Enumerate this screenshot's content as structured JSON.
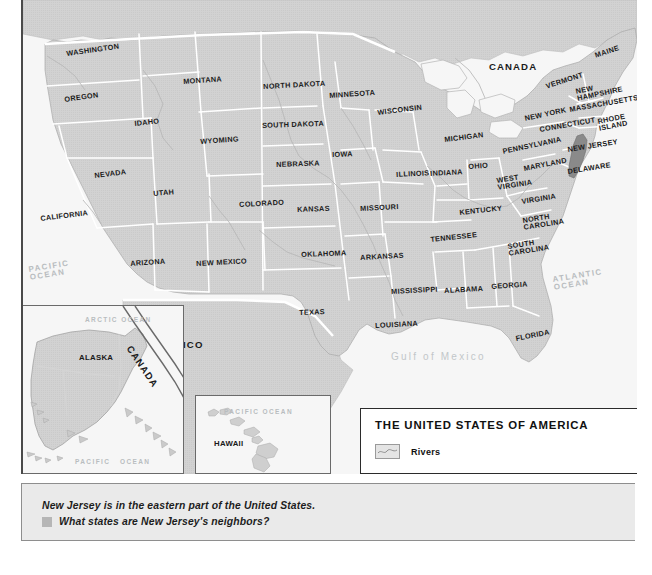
{
  "map": {
    "title": "THE UNITED STATES OF AMERICA",
    "legend": {
      "rivers_label": "Rivers",
      "rivers_swatch": "river-swatch"
    },
    "colors": {
      "land": "#d2d2d2",
      "highlight_state": "#8a8a8a",
      "water": "#f6f6f6",
      "border": "#ffffff",
      "frame": "#4a4a4a",
      "caption_bg": "#eaeaea"
    },
    "highlighted_state": "NEW JERSEY",
    "countries": [
      {
        "name": "CANADA",
        "x": 487,
        "y": 66,
        "rot": 0,
        "cls": "big"
      },
      {
        "name": "MEXICO",
        "x": 157,
        "y": 345,
        "rot": 0,
        "cls": "big"
      },
      {
        "name": "CANADA",
        "x": 96,
        "y": 337,
        "rot": 52,
        "cls": "big"
      }
    ],
    "states": [
      {
        "name": "WASHINGTON",
        "x": 64,
        "y": 55,
        "rot": -8
      },
      {
        "name": "OREGON",
        "x": 62,
        "y": 100,
        "rot": -8
      },
      {
        "name": "IDAHO",
        "x": 132,
        "y": 124,
        "rot": -6
      },
      {
        "name": "MONTANA",
        "x": 181,
        "y": 82,
        "rot": -4
      },
      {
        "name": "WYOMING",
        "x": 198,
        "y": 142,
        "rot": -4
      },
      {
        "name": "NEVADA",
        "x": 92,
        "y": 176,
        "rot": -7
      },
      {
        "name": "UTAH",
        "x": 151,
        "y": 194,
        "rot": -5
      },
      {
        "name": "CALIFORNIA",
        "x": 38,
        "y": 219,
        "rot": -7
      },
      {
        "name": "ARIZONA",
        "x": 128,
        "y": 264,
        "rot": -4
      },
      {
        "name": "NEW MEXICO",
        "x": 194,
        "y": 264,
        "rot": -3
      },
      {
        "name": "COLORADO",
        "x": 237,
        "y": 205,
        "rot": -3
      },
      {
        "name": "NORTH DAKOTA",
        "x": 261,
        "y": 87,
        "rot": -3
      },
      {
        "name": "SOUTH DAKOTA",
        "x": 260,
        "y": 126,
        "rot": -2
      },
      {
        "name": "NEBRASKA",
        "x": 274,
        "y": 165,
        "rot": -2
      },
      {
        "name": "KANSAS",
        "x": 295,
        "y": 210,
        "rot": -2
      },
      {
        "name": "OKLAHOMA",
        "x": 299,
        "y": 255,
        "rot": -2
      },
      {
        "name": "TEXAS",
        "x": 297,
        "y": 313,
        "rot": -2
      },
      {
        "name": "MINNESOTA",
        "x": 327,
        "y": 96,
        "rot": -4
      },
      {
        "name": "IOWA",
        "x": 330,
        "y": 155,
        "rot": -2
      },
      {
        "name": "MISSOURI",
        "x": 358,
        "y": 209,
        "rot": -3
      },
      {
        "name": "ARKANSAS",
        "x": 358,
        "y": 258,
        "rot": -3
      },
      {
        "name": "LOUISIANA",
        "x": 373,
        "y": 326,
        "rot": -3
      },
      {
        "name": "WISCONSIN",
        "x": 375,
        "y": 113,
        "rot": -7
      },
      {
        "name": "ILLINOIS",
        "x": 394,
        "y": 175,
        "rot": -3
      },
      {
        "name": "INDIANA",
        "x": 428,
        "y": 174,
        "rot": -3
      },
      {
        "name": "MICHIGAN",
        "x": 442,
        "y": 140,
        "rot": -7
      },
      {
        "name": "OHIO",
        "x": 466,
        "y": 167,
        "rot": -4
      },
      {
        "name": "KENTUCKY",
        "x": 457,
        "y": 213,
        "rot": -6
      },
      {
        "name": "TENNESSEE",
        "x": 428,
        "y": 240,
        "rot": -6
      },
      {
        "name": "MISSISSIPPI",
        "x": 389,
        "y": 292,
        "rot": -3
      },
      {
        "name": "ALABAMA",
        "x": 442,
        "y": 291,
        "rot": -3
      },
      {
        "name": "GEORGIA",
        "x": 489,
        "y": 287,
        "rot": -4
      },
      {
        "name": "FLORIDA",
        "x": 513,
        "y": 339,
        "rot": -11
      },
      {
        "name": "SOUTH\nCAROLINA",
        "x": 505,
        "y": 247,
        "rot": -9
      },
      {
        "name": "NORTH\nCAROLINA",
        "x": 520,
        "y": 221,
        "rot": -9
      },
      {
        "name": "VIRGINIA",
        "x": 519,
        "y": 202,
        "rot": -9
      },
      {
        "name": "WEST\nVIRGINIA",
        "x": 494,
        "y": 181,
        "rot": -9
      },
      {
        "name": "MARYLAND",
        "x": 521,
        "y": 169,
        "rot": -11
      },
      {
        "name": "PENNSYLVANIA",
        "x": 500,
        "y": 152,
        "rot": -12
      },
      {
        "name": "NEW YORK",
        "x": 522,
        "y": 119,
        "rot": -12
      },
      {
        "name": "VERMONT",
        "x": 543,
        "y": 87,
        "rot": -18
      },
      {
        "name": "NEW\nHAMPSHIRE",
        "x": 573,
        "y": 92,
        "rot": -12
      },
      {
        "name": "MAINE",
        "x": 592,
        "y": 56,
        "rot": -18
      },
      {
        "name": "MASSACHUSETTS",
        "x": 567,
        "y": 110,
        "rot": -10
      },
      {
        "name": "CONNECTICUT",
        "x": 537,
        "y": 130,
        "rot": -10
      },
      {
        "name": "RHODE\nISLAND",
        "x": 595,
        "y": 122,
        "rot": -11
      },
      {
        "name": "NEW JERSEY",
        "x": 565,
        "y": 150,
        "rot": -9
      },
      {
        "name": "DELAWARE",
        "x": 565,
        "y": 172,
        "rot": -9
      }
    ],
    "oceans": [
      {
        "name": "PACIFIC\nOCEAN",
        "x": 26,
        "y": 266,
        "rot": -9
      },
      {
        "name": "ATLANTIC\nOCEAN",
        "x": 550,
        "y": 276,
        "rot": -9
      },
      {
        "name": "Gulf of Mexico",
        "x": 389,
        "y": 356,
        "rot": 0
      }
    ],
    "insets": {
      "alaska": {
        "state_label": "ALASKA",
        "country_label": "CANADA",
        "ocean_top": "ARCTIC OCEAN",
        "ocean_bottom": "PACIFIC   OCEAN"
      },
      "hawaii": {
        "state_label": "HAWAII",
        "ocean_label": "PACIFIC OCEAN"
      }
    }
  },
  "caption": {
    "statement": "New Jersey is in the eastern part of the United States.",
    "question": "What states are New Jersey's neighbors?"
  }
}
